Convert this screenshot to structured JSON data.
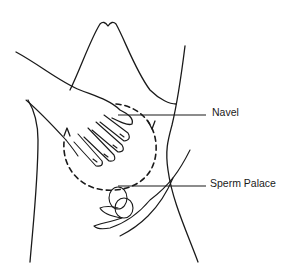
{
  "figure": {
    "labels": {
      "navel": "Navel",
      "sperm_palace": "Sperm Palace"
    },
    "circle_direction": "clockwise",
    "colors": {
      "ink": "#1a1a1a",
      "background": "#ffffff"
    }
  }
}
